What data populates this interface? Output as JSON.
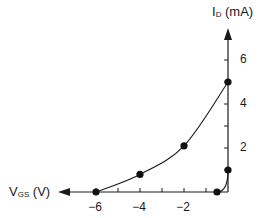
{
  "chart_data": {
    "type": "line",
    "title": "",
    "xlabel": "V_GS (V)",
    "ylabel": "I_D (mA)",
    "xlabel_main": "V",
    "xlabel_sub": "GS",
    "xlabel_unit": " (V)",
    "ylabel_main": "I",
    "ylabel_sub": "D",
    "ylabel_unit": " (mA)",
    "xlim": [
      -7,
      0
    ],
    "ylim": [
      0,
      7
    ],
    "x_ticks": [
      -6,
      -5,
      -4,
      -3,
      -2,
      -1
    ],
    "x_tick_labels": [
      "-6",
      "-4",
      "-2"
    ],
    "x_tick_label_values": [
      -6,
      -4,
      -2
    ],
    "y_ticks": [
      1,
      2,
      3,
      4,
      5,
      6
    ],
    "y_tick_labels": [
      "2",
      "4",
      "6"
    ],
    "y_tick_label_values": [
      2,
      4,
      6
    ],
    "grid": false,
    "legend": null,
    "series": [
      {
        "name": "transfer curve (main)",
        "x": [
          -6,
          -4,
          -2,
          0
        ],
        "y": [
          0,
          0.8,
          2.1,
          5
        ]
      },
      {
        "name": "transfer curve (steep)",
        "x": [
          -0.5,
          0
        ],
        "y": [
          0,
          1
        ]
      }
    ],
    "markers": [
      {
        "x": -6,
        "y": 0
      },
      {
        "x": -4,
        "y": 0.8
      },
      {
        "x": -2,
        "y": 2.1
      },
      {
        "x": 0,
        "y": 5
      },
      {
        "x": -0.5,
        "y": 0
      },
      {
        "x": 0,
        "y": 1
      }
    ],
    "colors": {
      "line": "#1a1a1a",
      "marker": "#111111",
      "axis": "#1a1a1a"
    }
  }
}
